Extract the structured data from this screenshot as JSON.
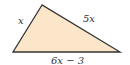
{
  "diagram": {
    "shape": "triangle",
    "fill_color": "#fce6ca",
    "stroke_color": "#333333",
    "sides": {
      "left": "x",
      "right": "5x",
      "bottom": "6x − 3"
    }
  }
}
